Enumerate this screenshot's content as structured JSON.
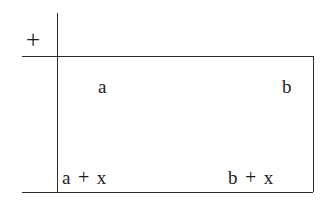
{
  "figure": {
    "kind": "addition-table",
    "operator_symbol": "+",
    "colors": {
      "background": "#ffffff",
      "rule": "#2b2b2b",
      "text": "#1c1c1c"
    }
  },
  "table": {
    "column_headers": [
      {
        "id": "a",
        "label": "a"
      },
      {
        "id": "b",
        "label": "b"
      }
    ],
    "rows": [
      {
        "id": "row-x",
        "cells": [
          {
            "id": "a-plus-x",
            "left": "a",
            "operator": "+",
            "right": "x",
            "text": "a + x"
          },
          {
            "id": "b-plus-x",
            "left": "b",
            "operator": "+",
            "right": "x",
            "text": "b + x"
          }
        ]
      }
    ]
  }
}
